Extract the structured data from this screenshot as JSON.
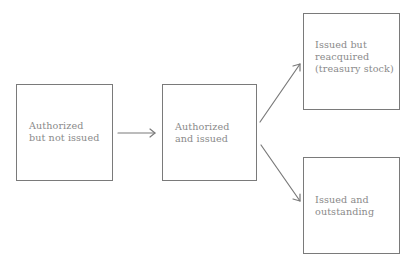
{
  "diagram": {
    "type": "flowchart",
    "stroke_color": "#7a7a7a",
    "text_color": "#8a8a8a",
    "nodes": [
      {
        "id": "authorized_not_issued",
        "label_lines": [
          "Authorized",
          "but not issued"
        ]
      },
      {
        "id": "authorized_issued",
        "label_lines": [
          "Authorized",
          "and issued"
        ]
      },
      {
        "id": "treasury_stock",
        "label_lines": [
          "Issued but",
          "reacquired",
          "(treasury stock)"
        ]
      },
      {
        "id": "issued_outstanding",
        "label_lines": [
          "Issued and",
          "outstanding"
        ]
      }
    ],
    "edges": [
      {
        "from": "authorized_not_issued",
        "to": "authorized_issued"
      },
      {
        "from": "authorized_issued",
        "to": "treasury_stock"
      },
      {
        "from": "authorized_issued",
        "to": "issued_outstanding"
      }
    ]
  }
}
